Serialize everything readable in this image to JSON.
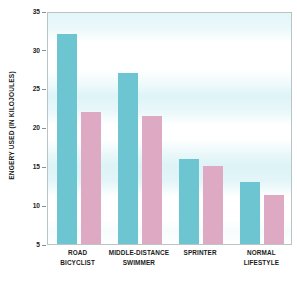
{
  "chart_data": {
    "type": "bar",
    "title": "",
    "xlabel": "",
    "ylabel": "ENGERY USED (IN KILOJOULES)",
    "ylim": [
      5,
      35
    ],
    "ytick_step": 5,
    "yticks": [
      35,
      30,
      25,
      20,
      15,
      10,
      5
    ],
    "ytick_labels": [
      "35",
      "30",
      "25",
      "20",
      "15",
      "10",
      "5"
    ],
    "grid": false,
    "background_bands": true,
    "legend": null,
    "legend_position": "none",
    "categories": [
      "ROAD BICYCLIST",
      "MIDDLE-DISTANCE SWIMMER",
      "SPRINTER",
      "NORMAL LIFESTYLE"
    ],
    "category_lines": [
      [
        "ROAD",
        "BICYCLIST"
      ],
      [
        "MIDDLE-DISTANCE",
        "SWIMMER"
      ],
      [
        "SPRINTER",
        ""
      ],
      [
        "NORMAL",
        "LIFESTYLE"
      ]
    ],
    "series": [
      {
        "name": "teal-series",
        "color": "#6dc5d1",
        "values": [
          32,
          27,
          16,
          13
        ]
      },
      {
        "name": "pink-series",
        "color": "#dda9c3",
        "values": [
          22,
          21.5,
          15,
          11.3
        ]
      }
    ]
  },
  "colors": {
    "teal": "#6dc5d1",
    "pink": "#dda9c3",
    "axis_text": "#1b1b1b",
    "plot_border": "#b9c4c4",
    "band": "#ddf3f6"
  }
}
